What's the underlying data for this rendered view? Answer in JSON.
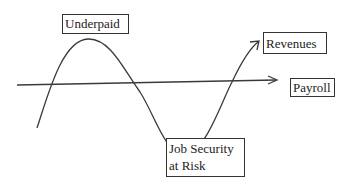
{
  "diagram": {
    "labels": {
      "underpaid": "Underpaid",
      "revenues": "Revenues",
      "payroll": "Payroll",
      "job_security_line1": "Job Security",
      "job_security_line2": "at Risk"
    },
    "series": [
      {
        "name": "Revenues",
        "shape": "sine-wave with arrow",
        "color": "#333333"
      },
      {
        "name": "Payroll",
        "shape": "horizontal line with arrow",
        "color": "#333333"
      }
    ],
    "annotations": [
      {
        "text": "Underpaid",
        "position": "above wave peak"
      },
      {
        "text": "Job Security at Risk",
        "position": "below wave trough"
      }
    ]
  }
}
